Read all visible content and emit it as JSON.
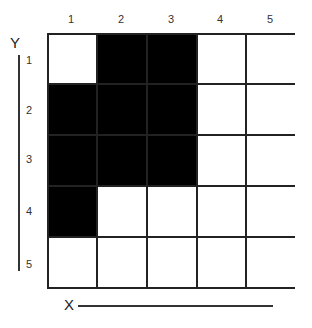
{
  "diagram": {
    "type": "grid",
    "columns": 5,
    "rows": 5,
    "axis": {
      "x_label": "X",
      "y_label": "Y"
    },
    "column_labels": [
      "1",
      "2",
      "3",
      "4",
      "5"
    ],
    "row_labels": [
      "1",
      "2",
      "3",
      "4",
      "5"
    ],
    "filled_color": "#000000",
    "empty_color": "#ffffff",
    "filled_cells": [
      {
        "row": 1,
        "col": 2
      },
      {
        "row": 1,
        "col": 3
      },
      {
        "row": 2,
        "col": 1
      },
      {
        "row": 2,
        "col": 2
      },
      {
        "row": 2,
        "col": 3
      },
      {
        "row": 3,
        "col": 1
      },
      {
        "row": 3,
        "col": 2
      },
      {
        "row": 3,
        "col": 3
      },
      {
        "row": 4,
        "col": 1
      }
    ],
    "grid_matrix": [
      [
        0,
        1,
        1,
        0,
        0
      ],
      [
        1,
        1,
        1,
        0,
        0
      ],
      [
        1,
        1,
        1,
        0,
        0
      ],
      [
        1,
        0,
        0,
        0,
        0
      ],
      [
        0,
        0,
        0,
        0,
        0
      ]
    ]
  }
}
